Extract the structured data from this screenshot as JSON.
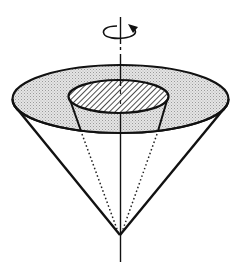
{
  "diagram": {
    "title": "",
    "colors": {
      "stroke": "#111111",
      "outer_fill": "#d6d6d6",
      "hatch": "#222222",
      "background": "#ffffff"
    },
    "elements": {
      "rotation_arrow": "rotation-arrow-icon",
      "axis": "vertical-axis",
      "outer_ellipse": "outer-cone-top",
      "inner_ellipse": "inner-frustum-top",
      "cone_sides": "cone-side-lines",
      "inner_dotted": "inner-dotted-lines"
    }
  }
}
